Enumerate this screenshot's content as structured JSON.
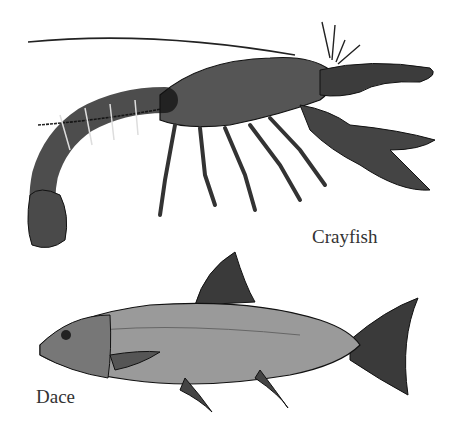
{
  "illustration": {
    "labels": {
      "crayfish": "Crayfish",
      "dace": "Dace"
    },
    "colors": {
      "background": "#ffffff",
      "ink": "#1a1a1a",
      "shell": "#555555",
      "fish_body": "#9a9a9a",
      "fish_fin": "#3a3a3a"
    }
  }
}
